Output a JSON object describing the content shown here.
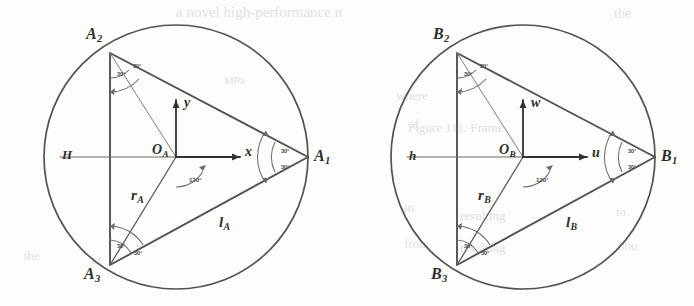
{
  "figure": {
    "type": "geometry-diagram",
    "panel_count": 2,
    "ink_color": "#555250",
    "label_color": "#2e2e2e",
    "angle_color": "#4a4a4a"
  },
  "panels": [
    {
      "id": "panel-a",
      "circle": {
        "cx": 176,
        "cy": 157,
        "r": 132
      },
      "vertices": [
        {
          "name": "A1",
          "base": "A",
          "sub": "1",
          "x": 308,
          "y": 157,
          "label_x": 314,
          "label_y": 148
        },
        {
          "name": "A2",
          "base": "A",
          "sub": "2",
          "x": 110,
          "y": 53,
          "label_x": 86,
          "label_y": 26
        },
        {
          "name": "A3",
          "base": "A",
          "sub": "3",
          "x": 110,
          "y": 265,
          "label_x": 84,
          "label_y": 266
        }
      ],
      "origin": {
        "name": "OA",
        "base": "O",
        "sub": "A",
        "x": 176,
        "y": 157,
        "label_x": 152,
        "label_y": 143
      },
      "axes": [
        {
          "name": "x-axis",
          "base": "x",
          "sub": "",
          "x1": 176,
          "y1": 157,
          "x2": 240,
          "y2": 157,
          "label_x": 245,
          "label_y": 145
        },
        {
          "name": "y-axis",
          "base": "y",
          "sub": "",
          "x1": 176,
          "y1": 157,
          "x2": 176,
          "y2": 100,
          "label_x": 184,
          "label_y": 96
        }
      ],
      "datum": {
        "name": "H",
        "base": "H",
        "sub": "",
        "x1": 60,
        "y1": 157,
        "x2": 176,
        "y2": 157,
        "label_x": 62,
        "label_y": 148
      },
      "radius_line": {
        "name": "rA",
        "base": "r",
        "sub": "A",
        "from_x": 176,
        "from_y": 157,
        "to_x": 110,
        "to_y": 265,
        "label_x": 131,
        "label_y": 188
      },
      "side_line": {
        "name": "lA",
        "base": "l",
        "sub": "A",
        "label_x": 219,
        "label_y": 215
      },
      "chord_line": {
        "from_x": 110,
        "from_y": 53,
        "to_x": 176,
        "to_y": 157
      },
      "angles": [
        {
          "at": "A2",
          "value": "30°",
          "x": 117,
          "y": 71
        },
        {
          "at": "A2",
          "value": "30°",
          "x": 133,
          "y": 63
        },
        {
          "at": "A3",
          "value": "30°",
          "x": 117,
          "y": 243
        },
        {
          "at": "A3",
          "value": "30°",
          "x": 134,
          "y": 250
        },
        {
          "at": "A1",
          "value": "30°",
          "x": 281,
          "y": 148
        },
        {
          "at": "A1",
          "value": "30°",
          "x": 281,
          "y": 164
        },
        {
          "at": "OA",
          "value": "120°",
          "x": 189,
          "y": 176
        }
      ]
    },
    {
      "id": "panel-b",
      "circle": {
        "cx": 176,
        "cy": 157,
        "r": 132
      },
      "vertices": [
        {
          "name": "B1",
          "base": "B",
          "sub": "1",
          "x": 308,
          "y": 157,
          "label_x": 314,
          "label_y": 148
        },
        {
          "name": "B2",
          "base": "B",
          "sub": "2",
          "x": 110,
          "y": 53,
          "label_x": 86,
          "label_y": 26
        },
        {
          "name": "B3",
          "base": "B",
          "sub": "3",
          "x": 110,
          "y": 265,
          "label_x": 84,
          "label_y": 266
        }
      ],
      "origin": {
        "name": "OB",
        "base": "O",
        "sub": "B",
        "x": 176,
        "y": 157,
        "label_x": 152,
        "label_y": 143
      },
      "axes": [
        {
          "name": "u-axis",
          "base": "u",
          "sub": "",
          "x1": 176,
          "y1": 157,
          "x2": 240,
          "y2": 157,
          "label_x": 245,
          "label_y": 146
        },
        {
          "name": "w-axis",
          "base": "w",
          "sub": "",
          "x1": 176,
          "y1": 157,
          "x2": 176,
          "y2": 100,
          "label_x": 184,
          "label_y": 96
        }
      ],
      "datum": {
        "name": "h",
        "base": "h",
        "sub": "",
        "x1": 60,
        "y1": 157,
        "x2": 176,
        "y2": 157,
        "label_x": 62,
        "label_y": 149
      },
      "radius_line": {
        "name": "rB",
        "base": "r",
        "sub": "B",
        "from_x": 176,
        "from_y": 157,
        "to_x": 110,
        "to_y": 265,
        "label_x": 131,
        "label_y": 188
      },
      "side_line": {
        "name": "lB",
        "base": "l",
        "sub": "B",
        "label_x": 219,
        "label_y": 215
      },
      "chord_line": {
        "from_x": 110,
        "from_y": 53,
        "to_x": 176,
        "to_y": 157
      },
      "angles": [
        {
          "at": "B2",
          "value": "30°",
          "x": 117,
          "y": 71
        },
        {
          "at": "B2",
          "value": "30°",
          "x": 133,
          "y": 63
        },
        {
          "at": "B3",
          "value": "30°",
          "x": 117,
          "y": 243
        },
        {
          "at": "B3",
          "value": "30°",
          "x": 134,
          "y": 250
        },
        {
          "at": "B1",
          "value": "30°",
          "x": 281,
          "y": 148
        },
        {
          "at": "B1",
          "value": "30°",
          "x": 281,
          "y": 164
        },
        {
          "at": "OB",
          "value": "120°",
          "x": 189,
          "y": 176
        }
      ]
    }
  ],
  "bleed_through": [
    {
      "text": "a novel high-performance n",
      "x": 176,
      "y": 4,
      "size": 15
    },
    {
      "text": "the",
      "x": 614,
      "y": 6,
      "size": 14
    },
    {
      "text": "MPa",
      "x": 224,
      "y": 74,
      "size": 11
    },
    {
      "text": "where",
      "x": 396,
      "y": 88,
      "size": 13
    },
    {
      "text": "of",
      "x": 408,
      "y": 116,
      "size": 13
    },
    {
      "text": "Figure 111. Frame",
      "x": 408,
      "y": 120,
      "size": 13
    },
    {
      "text": "in",
      "x": 404,
      "y": 200,
      "size": 13
    },
    {
      "text": "resulting",
      "x": 460,
      "y": 208,
      "size": 13
    },
    {
      "text": "to",
      "x": 616,
      "y": 204,
      "size": 13
    },
    {
      "text": "the",
      "x": 24,
      "y": 248,
      "size": 13
    },
    {
      "text": "at",
      "x": 92,
      "y": 252,
      "size": 13
    },
    {
      "text": "from",
      "x": 404,
      "y": 236,
      "size": 13
    },
    {
      "text": "resulting",
      "x": 460,
      "y": 240,
      "size": 13
    },
    {
      "text": "hou",
      "x": 618,
      "y": 238,
      "size": 13
    }
  ]
}
